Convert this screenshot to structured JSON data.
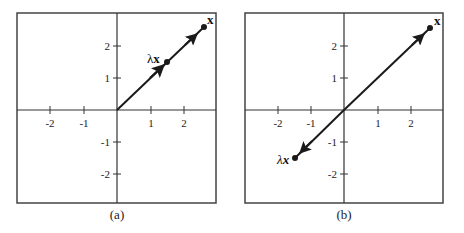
{
  "figure": {
    "panels": [
      {
        "id": "a",
        "caption": "(a)",
        "x_ticks": [
          {
            "value": -2,
            "label": "-2"
          },
          {
            "value": -1,
            "label": "-1"
          },
          {
            "value": 1,
            "label": "1"
          },
          {
            "value": 2,
            "label": "2"
          }
        ],
        "y_ticks": [
          {
            "value": 2,
            "label": "2"
          },
          {
            "value": 1,
            "label": "1"
          },
          {
            "value": -1,
            "label": "-1"
          },
          {
            "value": -2,
            "label": "-2"
          }
        ],
        "vectors": {
          "x": {
            "label": "x",
            "point": [
              2.6,
              2.6
            ]
          },
          "lambda_x": {
            "label_lambda": "λ",
            "label_x": "x",
            "point": [
              1.5,
              1.5
            ]
          }
        }
      },
      {
        "id": "b",
        "caption": "(b)",
        "x_ticks": [
          {
            "value": -2,
            "label": "-2"
          },
          {
            "value": -1,
            "label": "-1"
          },
          {
            "value": 1,
            "label": "1"
          },
          {
            "value": 2,
            "label": "2"
          }
        ],
        "y_ticks": [
          {
            "value": 2,
            "label": "2"
          },
          {
            "value": 1,
            "label": "1"
          },
          {
            "value": -1,
            "label": "-1"
          },
          {
            "value": -2,
            "label": "-2"
          }
        ],
        "vectors": {
          "x": {
            "label": "x",
            "point": [
              2.6,
              2.6
            ]
          },
          "lambda_x": {
            "label_lambda": "λ",
            "label_x": "x",
            "point": [
              -1.5,
              -1.5
            ]
          }
        }
      }
    ],
    "colors": {
      "line": "#1a1a1a",
      "background": "#ffffff"
    }
  }
}
